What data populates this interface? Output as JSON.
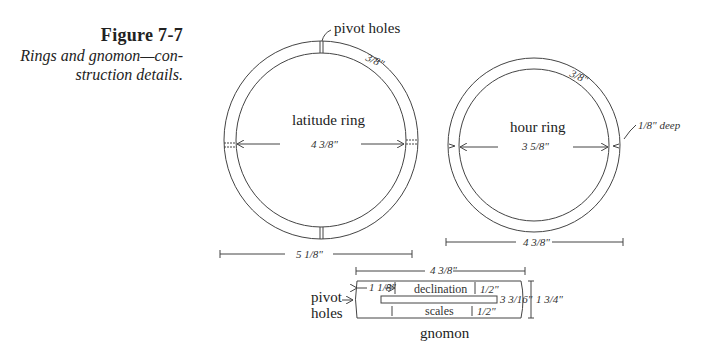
{
  "figure": {
    "title": "Figure 7-7",
    "subtitle_line1": "Rings and gnomon—con-",
    "subtitle_line2": "struction details."
  },
  "latitude_ring": {
    "label": "latitude ring",
    "inner_diameter": "4 3/8\"",
    "outer_diameter": "5 1/8\"",
    "width": "3/8\"",
    "callout": "pivot holes"
  },
  "hour_ring": {
    "label": "hour ring",
    "inner_diameter": "3 5/8\"",
    "outer_diameter": "4 3/8\"",
    "width": "3/8\"",
    "notch_depth": "1/8\" deep"
  },
  "gnomon": {
    "label": "gnomon",
    "length": "4 3/8\"",
    "offset": "1 1/8\"",
    "slot_length": "3 3/16\"",
    "height": "1 3/4\"",
    "top_margin": "1/2\"",
    "bottom_margin": "1/2\"",
    "upper_scale": "declination",
    "lower_scale": "scales",
    "callout_line1": "pivot",
    "callout_line2": "holes"
  },
  "colors": {
    "line": "#444444",
    "text": "#222222",
    "background": "#ffffff"
  }
}
